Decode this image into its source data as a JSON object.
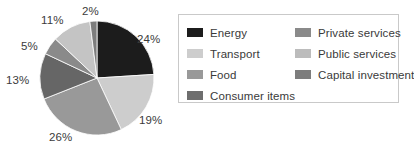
{
  "chart_data": {
    "type": "pie",
    "title": "",
    "categories": [
      "Energy",
      "Transport",
      "Food",
      "Consumer items",
      "Private services",
      "Public services",
      "Capital investment"
    ],
    "values": [
      24,
      19,
      26,
      13,
      5,
      11,
      2
    ],
    "value_labels": [
      "24%",
      "19%",
      "26%",
      "13%",
      "5%",
      "11%",
      "2%"
    ],
    "colors": [
      "#1c1c1c",
      "#cdcdcd",
      "#999999",
      "#666666",
      "#8a8a8a",
      "#c4c4c4",
      "#7d7d7d"
    ],
    "units": "percent",
    "total": 100,
    "start_angle_deg": 0,
    "direction": "clockwise",
    "legend_position": "right",
    "grid": false,
    "xlabel": "",
    "ylabel": ""
  },
  "pie": {
    "labels": [
      {
        "text": "24%",
        "left": 137,
        "top": 33
      },
      {
        "text": "19%",
        "left": 139,
        "top": 114
      },
      {
        "text": "26%",
        "left": 49,
        "top": 131
      },
      {
        "text": "13%",
        "left": 6,
        "top": 74
      },
      {
        "text": "5%",
        "left": 21,
        "top": 40
      },
      {
        "text": "11%",
        "left": 41,
        "top": 14
      },
      {
        "text": "2%",
        "left": 82,
        "top": 5
      }
    ]
  },
  "legend": {
    "columns": [
      {
        "items": [
          {
            "label": "Energy",
            "color": "#1c1c1c"
          },
          {
            "label": "Transport",
            "color": "#cdcdcd"
          },
          {
            "label": "Food",
            "color": "#999999"
          },
          {
            "label": "Consumer items",
            "color": "#6e6e6e"
          }
        ]
      },
      {
        "items": [
          {
            "label": "Private services",
            "color": "#8a8a8a"
          },
          {
            "label": "Public services",
            "color": "#bcbcbc"
          },
          {
            "label": "Capital investment",
            "color": "#7d7d7d"
          }
        ]
      }
    ]
  }
}
